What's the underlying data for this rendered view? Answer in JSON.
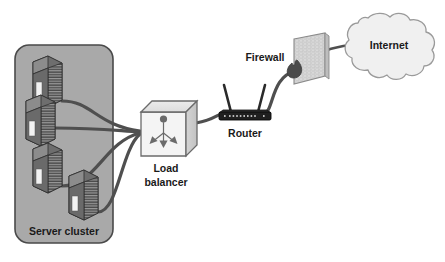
{
  "diagram": {
    "background_color": "#ffffff",
    "labels": {
      "server_cluster": "Server cluster",
      "load_balancer_line1": "Load",
      "load_balancer_line2": "balancer",
      "router": "Router",
      "firewall": "Firewall",
      "internet": "Internet"
    },
    "colors": {
      "cluster_fill": "#a9a9a9",
      "cluster_stroke": "#4a4a4a",
      "server_body": "#6e6e6e",
      "server_dark": "#3a3a3a",
      "server_panel": "#f2f2f2",
      "cable": "#4f4f4f",
      "load_balancer_fill": "#f4f4f4",
      "load_balancer_top": "#e2e2e2",
      "load_balancer_side": "#cfcfcf",
      "load_balancer_stroke": "#6b6b6b",
      "router_body": "#1f1f1f",
      "router_antenna": "#2a2a2a",
      "firewall_fill": "#d8d8d8",
      "firewall_stroke": "#8a8a8a",
      "flame": "#4a4a4a",
      "cloud_fill": "#f0f0f0",
      "cloud_stroke": "#9a9a9a",
      "text": "#1a1a1a"
    },
    "nodes": [
      {
        "id": "server-1",
        "type": "server",
        "label": "",
        "x": 47,
        "y": 76
      },
      {
        "id": "server-2",
        "type": "server",
        "label": "",
        "x": 40,
        "y": 115
      },
      {
        "id": "server-3",
        "type": "server",
        "label": "",
        "x": 47,
        "y": 163
      },
      {
        "id": "server-4",
        "type": "server",
        "label": "",
        "x": 83,
        "y": 200
      },
      {
        "id": "load-balancer",
        "type": "cube",
        "label": "Load balancer",
        "x": 166,
        "y": 129
      },
      {
        "id": "router",
        "type": "router",
        "label": "Router",
        "x": 245,
        "y": 117
      },
      {
        "id": "firewall",
        "type": "wall",
        "label": "Firewall",
        "x": 312,
        "y": 63
      },
      {
        "id": "internet",
        "type": "cloud",
        "label": "Internet",
        "x": 389,
        "y": 49
      }
    ],
    "links": [
      {
        "from": "server-1",
        "to": "load-balancer"
      },
      {
        "from": "server-2",
        "to": "load-balancer"
      },
      {
        "from": "server-3",
        "to": "load-balancer"
      },
      {
        "from": "server-4",
        "to": "load-balancer"
      },
      {
        "from": "load-balancer",
        "to": "router"
      },
      {
        "from": "router",
        "to": "firewall"
      },
      {
        "from": "firewall",
        "to": "internet"
      }
    ]
  }
}
